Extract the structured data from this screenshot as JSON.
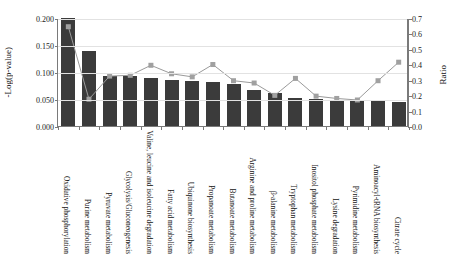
{
  "chart_data": {
    "type": "bar",
    "title": "",
    "xlabel": "",
    "ylabel": "-Log(p-value)",
    "y2label": "Ratio",
    "ylim": [
      0.0,
      0.2
    ],
    "y2lim": [
      0.0,
      0.7
    ],
    "grid": true,
    "legend": "none",
    "yticks": [
      "0.000",
      "0.050",
      "0.100",
      "0.150",
      "0.200"
    ],
    "ytick_values": [
      0.0,
      0.05,
      0.1,
      0.15,
      0.2
    ],
    "y2ticks": [
      "0.0",
      "0.1",
      "0.2",
      "0.3",
      "0.4",
      "0.5",
      "0.6",
      "0.7"
    ],
    "y2tick_values": [
      0.0,
      0.1,
      0.2,
      0.3,
      0.4,
      0.5,
      0.6,
      0.7
    ],
    "categories": [
      "Oxidative phosphorylation",
      "Purine metabolism",
      "Pyruvate metabolism",
      "Glycolysis/Gluconeogenesis",
      "Valine, leucine and isoleucine degradation",
      "Fatty acid metabolism",
      "Ubiquinone biosynthesis",
      "Propanoate metabolism",
      "Butanoate metabolism",
      "Arginine and proline metabolism",
      "β-alanine metabolism",
      "Tryptophan metabolism",
      "Inositol phosphate metabolism",
      "Lysine degradation",
      "Pyrimidine metabolism",
      "Aminoacyl-tRNA biosynthesis",
      "Citrate cycle"
    ],
    "series": [
      {
        "name": "-Log(p-value)",
        "type": "bar",
        "axis": "left",
        "color": "#3b3b3b",
        "values": [
          0.2,
          0.138,
          0.092,
          0.092,
          0.089,
          0.086,
          0.084,
          0.081,
          0.078,
          0.067,
          0.061,
          0.052,
          0.05,
          0.048,
          0.047,
          0.046,
          0.045
        ]
      },
      {
        "name": "Ratio",
        "type": "line",
        "axis": "right",
        "color": "#9a9a9a",
        "marker_color": "#a0a0a0",
        "values": [
          0.65,
          0.18,
          0.33,
          0.335,
          0.4,
          0.345,
          0.325,
          0.405,
          0.3,
          0.285,
          0.205,
          0.315,
          0.2,
          0.185,
          0.175,
          0.3,
          0.42
        ]
      }
    ]
  }
}
